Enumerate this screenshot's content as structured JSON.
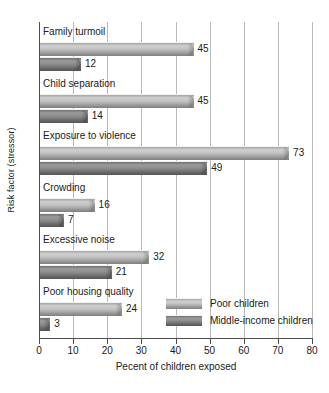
{
  "chart_data": {
    "type": "bar",
    "orientation": "horizontal",
    "title": "",
    "xlabel": "Pecent of children exposed",
    "ylabel": "Risk factor (stressor)",
    "xlim": [
      0,
      80
    ],
    "xticks": [
      0,
      10,
      20,
      30,
      40,
      50,
      60,
      70,
      80
    ],
    "grid": "vertical",
    "legend_position": "inside-bottom-right",
    "categories": [
      "Family turmoil",
      "Child separation",
      "Exposure to violence",
      "Crowding",
      "Excessive noise",
      "Poor housing quality"
    ],
    "series": [
      {
        "name": "Poor children",
        "color": "#c2c2c2",
        "values": [
          45,
          45,
          73,
          16,
          32,
          24
        ]
      },
      {
        "name": "Middle-income children",
        "color": "#8d8d8d",
        "values": [
          12,
          14,
          49,
          7,
          21,
          3
        ]
      }
    ]
  },
  "axis": {
    "x_title": "Pecent of children exposed",
    "y_title": "Risk factor (stressor)",
    "tick_labels": [
      "0",
      "10",
      "20",
      "30",
      "40",
      "50",
      "60",
      "70",
      "80"
    ]
  },
  "legend": {
    "items": [
      {
        "label": "Poor children"
      },
      {
        "label": "Middle-income children"
      }
    ]
  },
  "value_labels": {
    "family_turmoil": {
      "poor": "45",
      "middle": "12"
    },
    "child_separation": {
      "poor": "45",
      "middle": "14"
    },
    "exposure_to_violence": {
      "poor": "73",
      "middle": "49"
    },
    "crowding": {
      "poor": "16",
      "middle": "7"
    },
    "excessive_noise": {
      "poor": "32",
      "middle": "21"
    },
    "poor_housing_quality": {
      "poor": "24",
      "middle": "3"
    }
  }
}
